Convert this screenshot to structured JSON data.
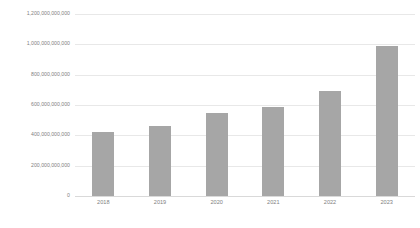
{
  "chart_data": {
    "type": "bar",
    "title": "",
    "xlabel": "",
    "ylabel": "",
    "categories": [
      "2018",
      "2019",
      "2020",
      "2021",
      "2022",
      "2023"
    ],
    "values": [
      420000000000,
      460000000000,
      550000000000,
      590000000000,
      695000000000,
      990000000000
    ],
    "series": [
      {
        "name": "",
        "values": [
          420000000000,
          460000000000,
          550000000000,
          590000000000,
          695000000000,
          990000000000
        ]
      }
    ],
    "ylim": [
      0,
      1200000000000
    ],
    "ytick_values": [
      0,
      200000000000,
      400000000000,
      600000000000,
      800000000000,
      1000000000000,
      1200000000000
    ],
    "ytick_labels": [
      "0",
      "200,000,000,000",
      "400,000,000,000",
      "600,000,000,000",
      "800,000,000,000",
      "1,000,000,000,000",
      "1,200,000,000,000"
    ],
    "xtick_labels": [
      "2018",
      "2019",
      "2020",
      "2021",
      "2022",
      "2023"
    ],
    "grid": true,
    "grid_axis": "y",
    "legend": false,
    "legend_position": "none",
    "bar_color": "#a6a6a6",
    "gridline_color": "#e8e8e8",
    "axis_text_color": "#7f7f7f",
    "background_color": "#ffffff"
  }
}
